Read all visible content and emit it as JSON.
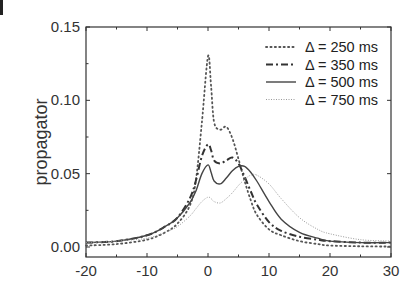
{
  "chart_data": {
    "type": "line",
    "title": "",
    "xlabel": "",
    "ylabel": "propagator",
    "xlim": [
      -20,
      30
    ],
    "ylim": [
      -0.0068,
      0.15
    ],
    "xticks": [
      -20,
      -10,
      0,
      10,
      20,
      30
    ],
    "xtick_labels": [
      "-20",
      "-10",
      "0",
      "10",
      "20",
      "30"
    ],
    "yticks": [
      0.0,
      0.05,
      0.1,
      0.15
    ],
    "ytick_labels": [
      "0.00",
      "0.05",
      "0.10",
      "0.15"
    ],
    "grid": false,
    "legend_position": "upper right",
    "x": [
      -20,
      -15,
      -10,
      -7,
      -5,
      -3,
      -2,
      -1,
      0,
      0.5,
      1,
      2,
      3,
      4,
      5,
      6,
      7,
      8,
      10,
      12,
      15,
      18,
      20,
      25,
      30
    ],
    "series": [
      {
        "name": "Δ = 250 ms",
        "style": "dotted",
        "values": [
          0.001,
          0.002,
          0.005,
          0.01,
          0.016,
          0.028,
          0.045,
          0.085,
          0.13,
          0.11,
          0.085,
          0.08,
          0.082,
          0.074,
          0.06,
          0.045,
          0.032,
          0.022,
          0.012,
          0.008,
          0.004,
          0.002,
          0.001,
          0.0005,
          0.0003
        ]
      },
      {
        "name": "Δ = 350 ms",
        "style": "dash-dot",
        "values": [
          0.003,
          0.004,
          0.008,
          0.014,
          0.02,
          0.033,
          0.045,
          0.062,
          0.07,
          0.066,
          0.059,
          0.057,
          0.059,
          0.061,
          0.057,
          0.048,
          0.038,
          0.029,
          0.017,
          0.011,
          0.007,
          0.005,
          0.004,
          0.003,
          0.003
        ]
      },
      {
        "name": "Δ = 500 ms",
        "style": "solid",
        "values": [
          0.003,
          0.004,
          0.008,
          0.014,
          0.02,
          0.03,
          0.038,
          0.05,
          0.056,
          0.051,
          0.045,
          0.043,
          0.047,
          0.052,
          0.055,
          0.055,
          0.051,
          0.045,
          0.031,
          0.019,
          0.01,
          0.006,
          0.004,
          0.003,
          0.003
        ]
      },
      {
        "name": "Δ = 750 ms",
        "style": "fine-dotted",
        "values": [
          0.003,
          0.004,
          0.006,
          0.01,
          0.014,
          0.021,
          0.026,
          0.031,
          0.034,
          0.033,
          0.031,
          0.03,
          0.033,
          0.037,
          0.042,
          0.046,
          0.049,
          0.049,
          0.043,
          0.033,
          0.02,
          0.012,
          0.009,
          0.005,
          0.004
        ]
      }
    ]
  },
  "legend": {
    "entries": [
      "Δ = 250 ms",
      "Δ = 350 ms",
      "Δ = 500 ms",
      "Δ = 750 ms"
    ]
  },
  "colors": {
    "axis": "#333333",
    "series_250": "#555555",
    "series_350": "#333333",
    "series_500": "#444444",
    "series_750": "#9a9a9a"
  }
}
